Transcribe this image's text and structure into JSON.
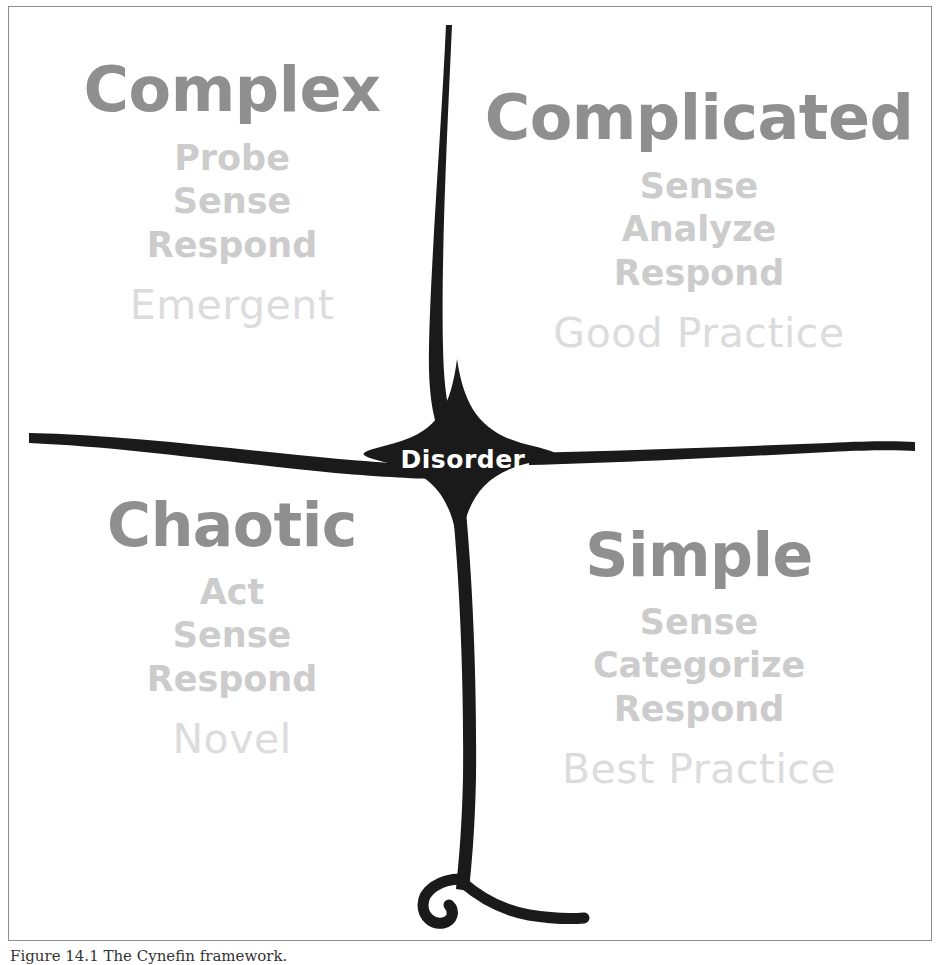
{
  "figure": {
    "caption": "Figure 14.1 The Cynefin framework.",
    "ink_color": "#1a1a1a",
    "title_color": "#8f8f8f",
    "steps_color": "#cccccc",
    "outcome_color": "#dcdcdc",
    "center_label_color": "#ffffff",
    "background_color": "#ffffff"
  },
  "center": {
    "label": "Disorder"
  },
  "quadrants": [
    {
      "id": "complex",
      "title": "Complex",
      "steps": [
        "Probe",
        "Sense",
        "Respond"
      ],
      "outcome": "Emergent"
    },
    {
      "id": "complicated",
      "title": "Complicated",
      "steps": [
        "Sense",
        "Analyze",
        "Respond"
      ],
      "outcome": "Good Practice"
    },
    {
      "id": "chaotic",
      "title": "Chaotic",
      "steps": [
        "Act",
        "Sense",
        "Respond"
      ],
      "outcome": "Novel"
    },
    {
      "id": "simple",
      "title": "Simple",
      "steps": [
        "Sense",
        "Categorize",
        "Respond"
      ],
      "outcome": "Best Practice"
    }
  ]
}
